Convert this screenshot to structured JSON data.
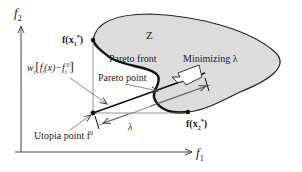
{
  "diagram": {
    "axes": {
      "y_label": "f",
      "y_sub": "2",
      "x_label": "f",
      "x_sub": "1"
    },
    "region_label": "Z",
    "pareto_front_label": "Pareto front",
    "pareto_point_label": "Pareto point",
    "minimizing_label": "Minimizing λ",
    "lambda_label": "λ",
    "utopia_label": "Utopia point f",
    "utopia_sup": "0",
    "endpoint_1": "f(x",
    "endpoint_1_sub": "1",
    "endpoint_1_sup": "*",
    "endpoint_2": "f(x",
    "endpoint_2_sub": "2",
    "endpoint_2_sup": "*",
    "weight_expr": "w",
    "weight_sub": "i",
    "weight_body": "f",
    "weight_body_sub": "i",
    "weight_arg": "(x)−f",
    "weight_arg_sub": "i",
    "weight_arg_sup": "0",
    "colors": {
      "region_fill": "#dcdcdc",
      "stroke": "#1a1a1a",
      "thin_line": "#555555"
    }
  }
}
